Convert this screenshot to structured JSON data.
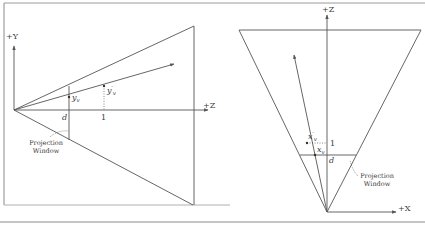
{
  "colors": {
    "line": "#555555",
    "frame": "#8a8a8a",
    "text": "#3a3a3a"
  },
  "left_diagram": {
    "axis_y_label": "+Y",
    "axis_z_label": "+Z",
    "d_label": "d",
    "one_label": "1",
    "yv_label": "y",
    "yv_sub": "v",
    "yv_prime_label": "y",
    "yv_prime_sub": "v",
    "yv_prime_mark": "′",
    "projection_window_line1": "Projection",
    "projection_window_line2": "Window"
  },
  "right_diagram": {
    "axis_z_label": "+Z",
    "axis_x_label": "+X",
    "d_label": "d",
    "one_label": "1",
    "xv_label": "x",
    "xv_sub": "v",
    "xv_prime_label": "x",
    "xv_prime_sub": "v",
    "xv_prime_mark": "′",
    "projection_window_line1": "Projection",
    "projection_window_line2": "Window"
  }
}
